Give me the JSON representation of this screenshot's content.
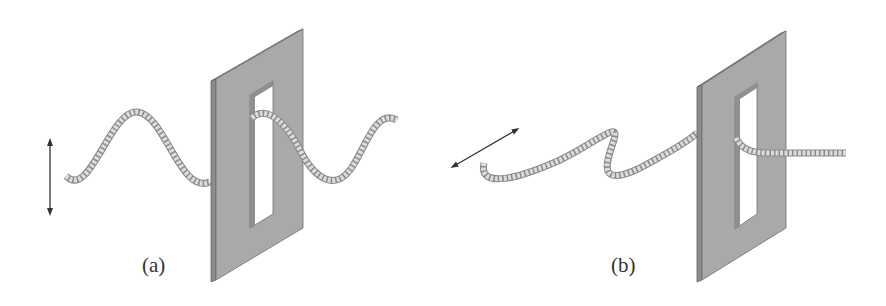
{
  "figure": {
    "panels": [
      {
        "id": "a",
        "label": "(a)",
        "description": "Vertically oscillating rope wave passes through a vertical slit",
        "oscillation_direction": "vertical",
        "transmitted": true
      },
      {
        "id": "b",
        "label": "(b)",
        "description": "Horizontally oscillating rope wave is blocked by a vertical slit",
        "oscillation_direction": "horizontal",
        "transmitted": false
      }
    ],
    "colors": {
      "plate_face": "#a9a9a9",
      "plate_edge": "#7a7a7a",
      "rope_fill": "#d6d6d6",
      "rope_stroke": "#8a8a8a",
      "arrow": "#333333",
      "text": "#333333"
    }
  }
}
